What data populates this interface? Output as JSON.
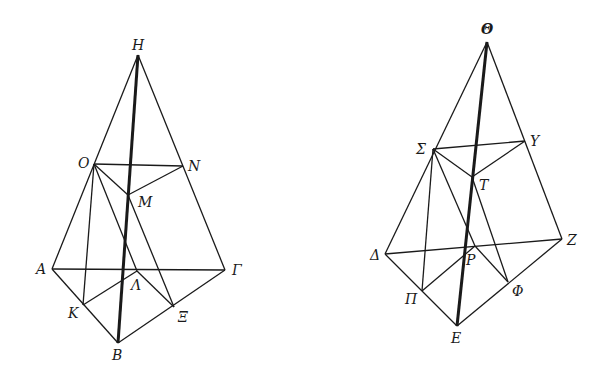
{
  "figures": [
    {
      "name": "left-pyramid",
      "points": {
        "H": [
          138,
          55
        ],
        "O": [
          94,
          164
        ],
        "N": [
          183,
          166
        ],
        "M": [
          128,
          195
        ],
        "A": [
          52,
          269
        ],
        "Gamma": [
          225,
          270
        ],
        "Lambda": [
          137,
          271
        ],
        "K": [
          83,
          305
        ],
        "Xi": [
          174,
          307
        ],
        "B": [
          118,
          343
        ]
      },
      "labels": {
        "H": "H",
        "O": "O",
        "N": "N",
        "M": "M",
        "A": "A",
        "Gamma": "Γ",
        "Lambda": "Λ",
        "K": "K",
        "Xi": "Ξ",
        "B": "B"
      }
    },
    {
      "name": "right-pyramid",
      "points": {
        "Theta": [
          487,
          42
        ],
        "Sigma": [
          433,
          149
        ],
        "Upsilon": [
          525,
          141
        ],
        "T": [
          472,
          177
        ],
        "Delta": [
          385,
          254
        ],
        "Z": [
          562,
          239
        ],
        "P": [
          475,
          246
        ],
        "Pi": [
          422,
          291
        ],
        "Phi": [
          508,
          282
        ],
        "E": [
          457,
          326
        ]
      },
      "labels": {
        "Theta": "Θ",
        "Sigma": "Σ",
        "Upsilon": "Υ",
        "T": "T",
        "Delta": "Δ",
        "Z": "Z",
        "P": "P",
        "Pi": "Π",
        "Phi": "Φ",
        "E": "E"
      }
    }
  ],
  "colors": {
    "ink": "#1a1a1a",
    "background": "#ffffff"
  }
}
